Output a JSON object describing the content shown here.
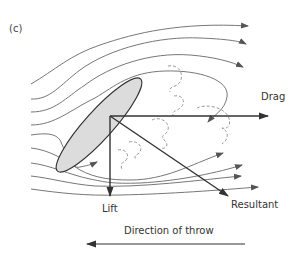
{
  "figure": {
    "panel_label": "(c)",
    "labels": {
      "drag": "Drag",
      "lift": "Lift",
      "resultant": "Resultant",
      "direction": "Direction of throw"
    },
    "colors": {
      "ellipse_fill": "#dcdcdc",
      "stroke": "#4a4a4a",
      "flow_line": "#777777",
      "vortex": "#999999",
      "text": "#333333"
    },
    "elements": {
      "object": "tilted ellipse (discus/javelin cross-section)",
      "force_vectors": [
        "Drag",
        "Lift",
        "Resultant"
      ],
      "upper_flow_lines": 4,
      "lower_flow_lines": 5,
      "wake_vortices": 6
    }
  }
}
